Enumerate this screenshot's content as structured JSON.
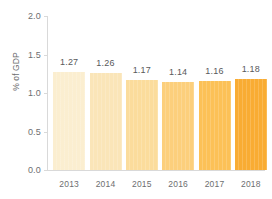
{
  "chart_data": {
    "type": "bar",
    "title": "",
    "subtitle": "",
    "xlabel": "",
    "ylabel": "% of GDP",
    "categories": [
      "2013",
      "2014",
      "2015",
      "2016",
      "2017",
      "2018"
    ],
    "values": [
      1.27,
      1.26,
      1.17,
      1.14,
      1.16,
      1.18
    ],
    "value_labels": [
      "1.27",
      "1.26",
      "1.17",
      "1.14",
      "1.16",
      "1.18"
    ],
    "ylim": [
      0.0,
      2.0
    ],
    "y_ticks": [
      0.0,
      0.5,
      1.0,
      1.5,
      2.0
    ],
    "y_tick_labels": [
      "0.0",
      "0.5",
      "1.0",
      "1.5",
      "2.0"
    ],
    "grid": false,
    "legend": "none",
    "bar_colors": [
      "#fbeed0",
      "#fae5b8",
      "#fbdc9c",
      "#fccf7c",
      "#fcc157",
      "#f9ac33"
    ],
    "axis_color": "#d9d9d9",
    "label_color": "#6d6e70",
    "value_label_color": "#58595b",
    "background": "#ffffff"
  }
}
